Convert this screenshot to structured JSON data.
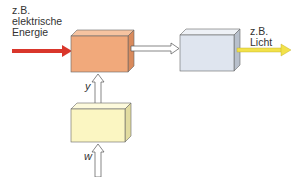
{
  "diagram": {
    "input_label": [
      "z.B.",
      "elektrische",
      "Energie"
    ],
    "output_label": [
      "z.B.",
      "Licht"
    ],
    "control_signal": "y",
    "reference_input": "w",
    "colors": {
      "input_arrow": "#d9362b",
      "output_arrow": "#f2e14a",
      "actuator_box": "#f1a97b",
      "process_box": "#dfe5ef",
      "controller_box": "#fbf6c2",
      "outline": "#555555"
    },
    "blocks": [
      {
        "id": "actuator",
        "color": "orange"
      },
      {
        "id": "process",
        "color": "light-blue"
      },
      {
        "id": "controller",
        "color": "light-yellow"
      }
    ]
  }
}
